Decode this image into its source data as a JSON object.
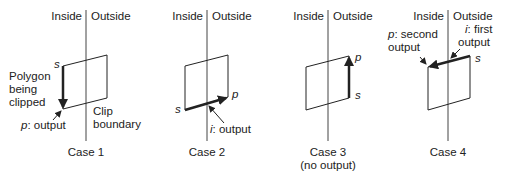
{
  "diagram": {
    "colors": {
      "stroke": "#222222",
      "clip_line": "#444444",
      "background": "#ffffff"
    },
    "region_labels": {
      "inside": "Inside",
      "outside": "Outside"
    },
    "cases": [
      {
        "caption": "Case 1",
        "subcaption": "",
        "vertex_s": "s",
        "vertex_p": "p",
        "annotation_p": ": output",
        "extra_left": [
          "Polygon",
          "being",
          "clipped"
        ],
        "extra_right": [
          "Clip",
          "boundary"
        ]
      },
      {
        "caption": "Case 2",
        "subcaption": "",
        "vertex_s": "s",
        "vertex_p": "p",
        "annotation_i_var": "i",
        "annotation_i": ": output"
      },
      {
        "caption": "Case 3",
        "subcaption": "(no output)",
        "vertex_s": "s",
        "vertex_p": "p"
      },
      {
        "caption": "Case 4",
        "subcaption": "",
        "vertex_s": "s",
        "vertex_p": "p",
        "annotation_p_var": "p",
        "annotation_p_line1": ": second",
        "annotation_p_line2": "output",
        "annotation_i_var": "i",
        "annotation_i_line1": ": first",
        "annotation_i_line2": "output"
      }
    ]
  }
}
